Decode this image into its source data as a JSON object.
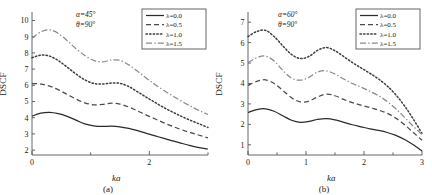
{
  "figure": {
    "panel_a_caption": "(a)",
    "panel_b_caption": "(b)",
    "ylabel": "DSCF",
    "xlabel": "ka"
  },
  "panel_a": {
    "annotation_alpha": "α=45°",
    "annotation_theta": "θ=90°",
    "caption": "(a)",
    "legend": [
      {
        "label": "λ=0.0",
        "style": "solid"
      },
      {
        "label": "λ=0.5",
        "style": "dashed"
      },
      {
        "label": "λ=1.0",
        "style": "dotted"
      },
      {
        "label": "λ=1.5",
        "style": "dashdot"
      }
    ]
  },
  "panel_b": {
    "annotation_alpha": "α=60°",
    "annotation_theta": "θ=90°",
    "caption": "(b)",
    "legend": [
      {
        "label": "λ=0.0",
        "style": "solid"
      },
      {
        "label": "λ=0.5",
        "style": "dashed"
      },
      {
        "label": "λ=1.0",
        "style": "dotted"
      },
      {
        "label": "λ=1.5",
        "style": "dashdot"
      }
    ]
  },
  "chart_data": [
    {
      "type": "line",
      "panel": "(a)",
      "title": "",
      "xlabel": "ka",
      "ylabel": "DSCF",
      "xlim": [
        0,
        3
      ],
      "ylim": [
        1.7,
        10.4
      ],
      "xticks": [
        0,
        1,
        2,
        3
      ],
      "xticklabels": [
        "0",
        "",
        "2",
        ""
      ],
      "yticks": [
        2,
        3,
        4,
        5,
        6,
        7,
        8,
        9,
        10
      ],
      "yticklabels": [
        "2",
        "3",
        "4",
        "5",
        "6",
        "7",
        "8",
        "9",
        "10"
      ],
      "grid": false,
      "legend_position": "top-right",
      "annotations": [
        "α=45°",
        "θ=90°"
      ],
      "x": [
        0,
        0.15,
        0.3,
        0.45,
        0.6,
        0.75,
        0.9,
        1.05,
        1.2,
        1.35,
        1.5,
        1.65,
        1.8,
        1.95,
        2.1,
        2.25,
        2.4,
        2.55,
        2.7,
        2.85,
        3.0
      ],
      "series": [
        {
          "name": "λ=0.0",
          "style": "solid",
          "values": [
            4.1,
            4.28,
            4.33,
            4.25,
            4.08,
            3.85,
            3.62,
            3.5,
            3.46,
            3.48,
            3.44,
            3.34,
            3.2,
            3.04,
            2.88,
            2.72,
            2.57,
            2.42,
            2.28,
            2.16,
            2.07
          ]
        },
        {
          "name": "λ=0.5",
          "style": "dashed",
          "values": [
            6.1,
            6.08,
            5.95,
            5.72,
            5.44,
            5.15,
            4.92,
            4.8,
            4.82,
            4.9,
            4.84,
            4.66,
            4.42,
            4.16,
            3.92,
            3.68,
            3.46,
            3.26,
            3.08,
            2.92,
            2.76
          ]
        },
        {
          "name": "λ=1.0",
          "style": "dotted",
          "values": [
            7.7,
            7.86,
            7.8,
            7.52,
            7.12,
            6.7,
            6.34,
            6.12,
            6.08,
            6.14,
            6.12,
            5.92,
            5.6,
            5.26,
            4.94,
            4.62,
            4.34,
            4.08,
            3.84,
            3.62,
            3.4
          ]
        },
        {
          "name": "λ=1.5",
          "style": "dashdot",
          "values": [
            8.9,
            9.3,
            9.42,
            9.2,
            8.76,
            8.26,
            7.84,
            7.54,
            7.44,
            7.56,
            7.54,
            7.26,
            6.86,
            6.44,
            6.04,
            5.68,
            5.34,
            5.02,
            4.72,
            4.44,
            4.2
          ]
        }
      ]
    },
    {
      "type": "line",
      "panel": "(b)",
      "title": "",
      "xlabel": "ka",
      "ylabel": "DSCF",
      "xlim": [
        0,
        3
      ],
      "ylim": [
        0.5,
        7.4
      ],
      "xticks": [
        0,
        0.5,
        1,
        1.5,
        2,
        2.5,
        3
      ],
      "xticklabels": [
        "0",
        "",
        "1",
        "",
        "2",
        "",
        "3"
      ],
      "yticks": [
        1,
        2,
        3,
        4,
        5,
        6,
        7
      ],
      "yticklabels": [
        "1",
        "2",
        "3",
        "4",
        "5",
        "6",
        "7"
      ],
      "grid": false,
      "legend_position": "top-right",
      "annotations": [
        "α=60°",
        "θ=90°"
      ],
      "x": [
        0,
        0.15,
        0.3,
        0.45,
        0.6,
        0.75,
        0.9,
        1.05,
        1.2,
        1.35,
        1.5,
        1.65,
        1.8,
        1.95,
        2.1,
        2.25,
        2.4,
        2.55,
        2.7,
        2.85,
        3.0
      ],
      "series": [
        {
          "name": "λ=0.0",
          "style": "solid",
          "values": [
            2.58,
            2.72,
            2.76,
            2.64,
            2.42,
            2.2,
            2.1,
            2.14,
            2.24,
            2.28,
            2.22,
            2.1,
            1.98,
            1.88,
            1.78,
            1.7,
            1.6,
            1.46,
            1.26,
            1.0,
            0.7
          ]
        },
        {
          "name": "λ=0.5",
          "style": "dashed",
          "values": [
            3.9,
            4.1,
            4.18,
            4.0,
            3.66,
            3.3,
            3.1,
            3.14,
            3.34,
            3.48,
            3.4,
            3.22,
            3.06,
            2.94,
            2.82,
            2.7,
            2.54,
            2.3,
            1.98,
            1.6,
            1.22
          ]
        },
        {
          "name": "λ=1.0",
          "style": "dotted",
          "values": [
            6.3,
            6.54,
            6.6,
            6.3,
            5.84,
            5.42,
            5.22,
            5.32,
            5.62,
            5.76,
            5.6,
            5.32,
            5.02,
            4.76,
            4.5,
            4.22,
            3.88,
            3.44,
            2.9,
            2.26,
            1.55
          ]
        },
        {
          "name": "λ=1.5",
          "style": "dashdot",
          "values": [
            5.02,
            5.26,
            5.34,
            5.1,
            4.64,
            4.26,
            4.16,
            4.3,
            4.56,
            4.62,
            4.46,
            4.22,
            4.0,
            3.82,
            3.62,
            3.4,
            3.12,
            2.76,
            2.34,
            1.9,
            1.5
          ]
        }
      ]
    }
  ]
}
